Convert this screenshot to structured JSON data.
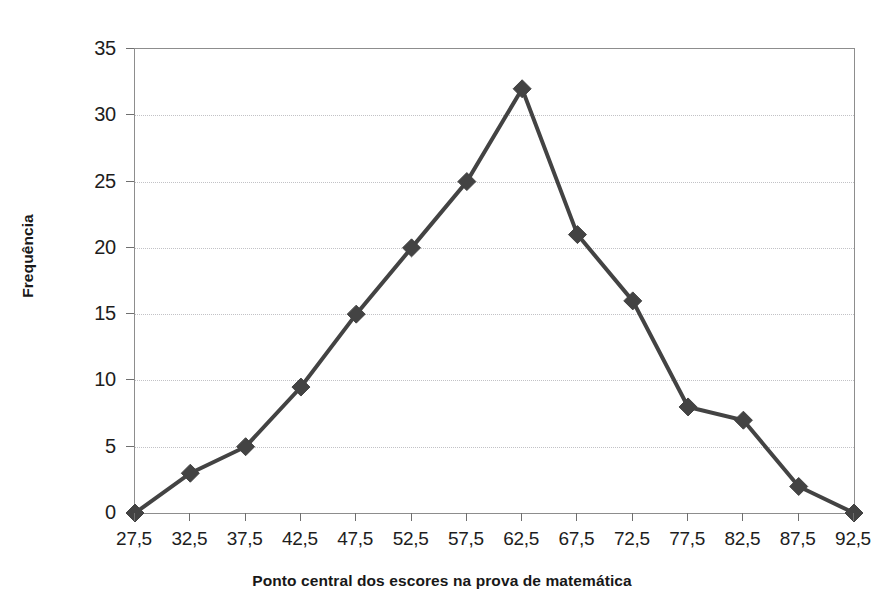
{
  "figure": {
    "top_clipped_text": "",
    "background_color": "#ffffff"
  },
  "chart_data": {
    "type": "line",
    "title": "",
    "subtitle": "",
    "xlabel": "Ponto central dos escores na prova de matemática",
    "ylabel": "Frequência",
    "categories": [
      "27,5",
      "32,5",
      "37,5",
      "42,5",
      "47,5",
      "52,5",
      "57,5",
      "62,5",
      "67,5",
      "72,5",
      "77,5",
      "82,5",
      "87,5",
      "92,5"
    ],
    "x": [
      27.5,
      32.5,
      37.5,
      42.5,
      47.5,
      52.5,
      57.5,
      62.5,
      67.5,
      72.5,
      77.5,
      82.5,
      87.5,
      92.5
    ],
    "values": [
      0,
      3,
      5,
      9.5,
      15,
      20,
      25,
      32,
      21,
      16,
      8,
      7,
      2,
      0
    ],
    "series": [
      {
        "name": "Frequência",
        "values": [
          0,
          3,
          5,
          9.5,
          15,
          20,
          25,
          32,
          21,
          16,
          8,
          7,
          2,
          0
        ],
        "color": "#434343",
        "marker": "diamond",
        "line_width": 4
      }
    ],
    "ylim": [
      0,
      35
    ],
    "yticks": [
      0,
      5,
      10,
      15,
      20,
      25,
      30,
      35
    ],
    "ytick_labels": [
      "0",
      "5",
      "10",
      "15",
      "20",
      "25",
      "30",
      "35"
    ],
    "xtick_labels": [
      "27,5",
      "32,5",
      "37,5",
      "42,5",
      "47,5",
      "52,5",
      "57,5",
      "62,5",
      "67,5",
      "72,5",
      "77,5",
      "82,5",
      "87,5",
      "92,5"
    ],
    "grid": {
      "horizontal": true,
      "vertical": false,
      "style": "dotted",
      "color": "#c2c2c6"
    },
    "legend": {
      "visible": false,
      "position": "none",
      "entries": []
    },
    "axis": {
      "border": true,
      "border_color": "#8d8d8d",
      "tick_color": "#6f6f6f"
    },
    "annotations": []
  }
}
